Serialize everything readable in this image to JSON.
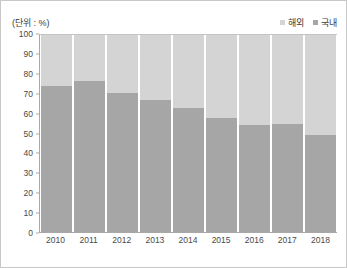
{
  "unit_label": "(단위 : %)",
  "legend": {
    "position": "top-right",
    "items": [
      {
        "label": "해외",
        "color": "#d4d4d4",
        "swatch": "legend-swatch-overseas"
      },
      {
        "label": "국내",
        "color": "#a6a6a6",
        "swatch": "legend-swatch-domestic"
      }
    ]
  },
  "chart_data": {
    "type": "bar",
    "stacked": true,
    "stack_total": 100,
    "title": "",
    "subtitle": "",
    "xlabel": "",
    "ylabel": "",
    "unit": "%",
    "ylim": [
      0,
      100
    ],
    "yticks": [
      0,
      10,
      20,
      30,
      40,
      50,
      60,
      70,
      80,
      90,
      100
    ],
    "ytick_labels": [
      "0",
      "10",
      "20",
      "30",
      "40",
      "50",
      "60",
      "70",
      "80",
      "90",
      "100"
    ],
    "grid": false,
    "legend_position": "top-right",
    "categories": [
      "2010",
      "2011",
      "2012",
      "2013",
      "2014",
      "2015",
      "2016",
      "2017",
      "2018"
    ],
    "series": [
      {
        "name": "국내",
        "color": "#a6a6a6",
        "values": [
          74,
          76.5,
          70.5,
          67,
          63,
          58,
          54.5,
          55,
          49.5
        ]
      },
      {
        "name": "해외",
        "color": "#d4d4d4",
        "values": [
          26,
          23.5,
          29.5,
          33,
          37,
          42,
          45.5,
          45,
          50.5
        ]
      }
    ]
  },
  "colors": {
    "overseas": "#d4d4d4",
    "domestic": "#a6a6a6",
    "axis": "#a8a8a8",
    "text": "#4a4a4a",
    "border": "#c8c8c8",
    "background": "#ffffff"
  }
}
